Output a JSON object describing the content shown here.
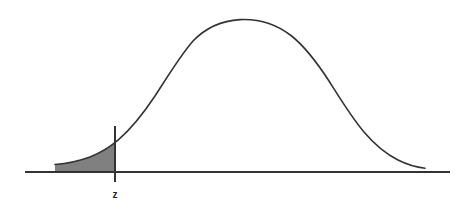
{
  "figure": {
    "name": "standard-normal-distribution-left-tail",
    "background_color": "#ffffff",
    "width": 476,
    "height": 212
  },
  "labels": {
    "z_label": "z"
  },
  "colors": {
    "curve_stroke": "#333333",
    "axis_stroke": "#333333",
    "shade_fill": "#808080",
    "label_text": "#222222"
  },
  "chart_data": {
    "type": "line",
    "title": "",
    "subtitle": "",
    "xlabel": "",
    "ylabel": "",
    "grid": false,
    "legend": null,
    "annotations": [
      {
        "name": "z-critical-line",
        "label": "z",
        "type": "vertical-line",
        "x": -1.65,
        "label_position": "below-axis"
      },
      {
        "name": "left-tail-shaded-region",
        "type": "shaded-area",
        "x_from": -3.2,
        "x_to": -1.65,
        "fill": "#808080"
      }
    ],
    "xlim": [
      -3.7,
      3.7
    ],
    "ylim": [
      0,
      1.05
    ],
    "x": [
      -3.7,
      -3.4,
      -3.2,
      -3.0,
      -2.8,
      -2.6,
      -2.4,
      -2.2,
      -2.0,
      -1.8,
      -1.65,
      -1.6,
      -1.4,
      -1.2,
      -1.0,
      -0.8,
      -0.6,
      -0.4,
      -0.2,
      0.0,
      0.2,
      0.4,
      0.6,
      0.8,
      1.0,
      1.2,
      1.4,
      1.6,
      1.8,
      2.0,
      2.2,
      2.4,
      2.6,
      2.8,
      3.0,
      3.2,
      3.4,
      3.7
    ],
    "values": [
      0.0012,
      0.0034,
      0.0063,
      0.0111,
      0.0198,
      0.034,
      0.0561,
      0.0889,
      0.1353,
      0.1979,
      0.2541,
      0.278,
      0.3753,
      0.4868,
      0.6065,
      0.7261,
      0.8353,
      0.9231,
      0.9802,
      1.0,
      0.9802,
      0.9231,
      0.8353,
      0.7261,
      0.6065,
      0.4868,
      0.3753,
      0.278,
      0.1979,
      0.1353,
      0.0889,
      0.0561,
      0.034,
      0.0198,
      0.0111,
      0.0063,
      0.0034,
      0.0012
    ],
    "series": [
      {
        "name": "normal-density",
        "values": [
          0.0012,
          0.0034,
          0.0063,
          0.0111,
          0.0198,
          0.034,
          0.0561,
          0.0889,
          0.1353,
          0.1979,
          0.2541,
          0.278,
          0.3753,
          0.4868,
          0.6065,
          0.7261,
          0.8353,
          0.9231,
          0.9802,
          1.0,
          0.9802,
          0.9231,
          0.8353,
          0.7261,
          0.6065,
          0.4868,
          0.3753,
          0.278,
          0.1979,
          0.1353,
          0.0889,
          0.0561,
          0.034,
          0.0198,
          0.0111,
          0.0063,
          0.0034,
          0.0012
        ]
      }
    ]
  },
  "geometry": {
    "axis": {
      "x1": 25,
      "y1": 172,
      "x2": 450,
      "y2": 172
    },
    "z_rule": {
      "x": 115,
      "y_top": 126,
      "y_bottom": 182
    },
    "z_label_pos": {
      "x": 115,
      "y": 198
    },
    "curve_path": "M 55 164.5 C 66 163.6, 78 161.4, 90 157.0 C 101 152.8, 110 147.0, 118 140.2 C 131 129.0, 143 114.0, 155 96.0 C 168 76.0, 180 56.0, 193 41.0 C 206 27.5, 222 20.6, 240 19.6 C 258 18.7, 276 24.0, 291 35.5 C 305 46.5, 317 62.5, 329 81.0 C 341 100.0, 352 118.0, 364 132.0 C 375 145.0, 386 154.0, 398 160.0 C 408 165.0, 417 167.4, 425 168.2",
    "shade_path": "M 55 164.5 C 66 163.6, 78 161.4, 90 157.0 C 101 152.8, 110 147.0, 115 142.7 L 115 171 L 55 171 Z"
  }
}
